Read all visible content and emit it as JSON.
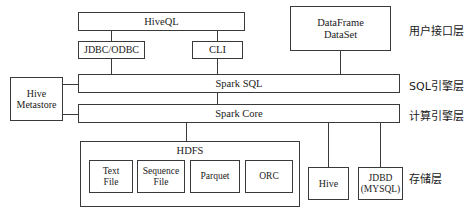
{
  "diagram": {
    "nodes": {
      "hiveql": "HiveQL",
      "dataframe_line1": "DataFrame",
      "dataframe_line2": "DataSet",
      "jdbc_odbc": "JDBC/ODBC",
      "cli": "CLI",
      "spark_sql": "Spark SQL",
      "spark_core": "Spark Core",
      "hive_metastore_line1": "Hive",
      "hive_metastore_line2": "Metastore",
      "hdfs": "HDFS",
      "text_file_line1": "Text",
      "text_file_line2": "File",
      "sequence_file_line1": "Sequence",
      "sequence_file_line2": "File",
      "parquet": "Parquet",
      "orc": "ORC",
      "hive": "Hive",
      "jdbd_line1": "JDBD",
      "jdbd_line2": "(MYSQL)"
    },
    "layers": [
      {
        "id": "user-interface-layer",
        "label": "用户接口层"
      },
      {
        "id": "sql-engine-layer",
        "label": "SQL引擎层"
      },
      {
        "id": "compute-engine-layer",
        "label": "计算引擎层"
      },
      {
        "id": "storage-layer",
        "label": "存储层"
      }
    ],
    "colors": {
      "stroke": "#3a3a3a",
      "text": "#1a1a1a",
      "background": "#ffffff"
    }
  }
}
